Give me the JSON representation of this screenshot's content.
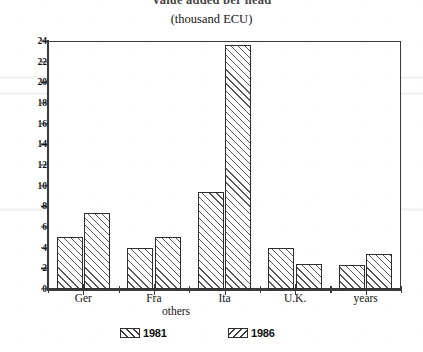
{
  "chart_data": {
    "type": "bar",
    "title": "Value added per head",
    "subtitle": "(thousand ECU)",
    "xlabel": "others",
    "ylabel": "",
    "categories": [
      "Ger",
      "Fra",
      "Ita",
      "U.K.",
      "years"
    ],
    "series": [
      {
        "name": "1981",
        "values": [
          5.0,
          4.0,
          9.4,
          4.0,
          2.3
        ]
      },
      {
        "name": "1986",
        "values": [
          7.4,
          5.0,
          23.6,
          2.4,
          3.4
        ]
      }
    ],
    "ylim": [
      0,
      24
    ],
    "ytick_step": 2,
    "ytick_labels": [
      "0",
      "2",
      "4",
      "6",
      "8",
      "10",
      "12",
      "14",
      "16",
      "18",
      "20",
      "22",
      "24"
    ],
    "grid": false,
    "legend_position": "bottom-center",
    "legend_entries": [
      {
        "label": "1981",
        "hatch": "forward-diagonal"
      },
      {
        "label": "1986",
        "hatch": "back-diagonal"
      }
    ],
    "frame": "box",
    "colors": {
      "axis": "#3a3a3a",
      "bar_edge": "#2e2e2e",
      "hatch": "#1e1e1e",
      "background": "#ffffff",
      "text": "#131313"
    }
  }
}
